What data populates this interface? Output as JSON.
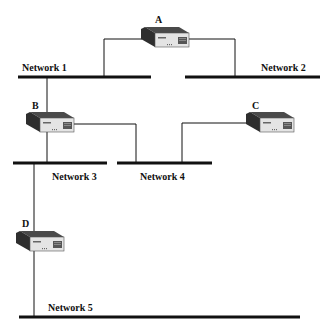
{
  "diagram": {
    "routers": [
      {
        "id": "A",
        "label": "A"
      },
      {
        "id": "B",
        "label": "B"
      },
      {
        "id": "C",
        "label": "C"
      },
      {
        "id": "D",
        "label": "D"
      }
    ],
    "networks": [
      {
        "id": "n1",
        "label": "Network 1"
      },
      {
        "id": "n2",
        "label": "Network 2"
      },
      {
        "id": "n3",
        "label": "Network 3"
      },
      {
        "id": "n4",
        "label": "Network 4"
      },
      {
        "id": "n5",
        "label": "Network 5"
      }
    ],
    "connections": [
      [
        "A",
        "Network 1"
      ],
      [
        "A",
        "Network 2"
      ],
      [
        "B",
        "Network 1"
      ],
      [
        "B",
        "Network 3"
      ],
      [
        "B",
        "Network 4"
      ],
      [
        "C",
        "Network 4"
      ],
      [
        "D",
        "Network 3"
      ],
      [
        "D",
        "Network 5"
      ]
    ],
    "colors": {
      "line": "#111111",
      "device_top": "#555555",
      "device_front": "#e6e6e6"
    }
  }
}
